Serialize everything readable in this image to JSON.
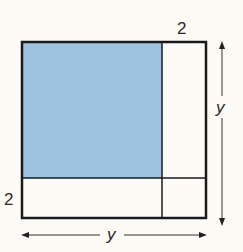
{
  "diagram": {
    "top_label": "2",
    "left_label": "2",
    "right_label": "y",
    "bottom_label": "y",
    "colors": {
      "shaded": "#9ec3e0",
      "line": "#1a1a1a",
      "background": "#fdfbf6"
    }
  }
}
